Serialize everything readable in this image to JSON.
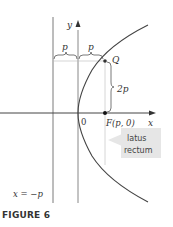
{
  "figure": {
    "caption": "FIGURE 6",
    "labels": {
      "y_axis": "y",
      "x_axis": "x",
      "origin": "0",
      "p_left": "p",
      "p_right": "p",
      "point_q": "Q",
      "two_p": "2p",
      "focus": "F(p, 0)",
      "directrix": "x = −p",
      "latus_line1": "latus",
      "latus_line2": "rectum"
    },
    "colors": {
      "axis": "#333333",
      "directrix": "#777777",
      "curve": "#444444",
      "callout_bg": "#e6e6e6"
    }
  }
}
